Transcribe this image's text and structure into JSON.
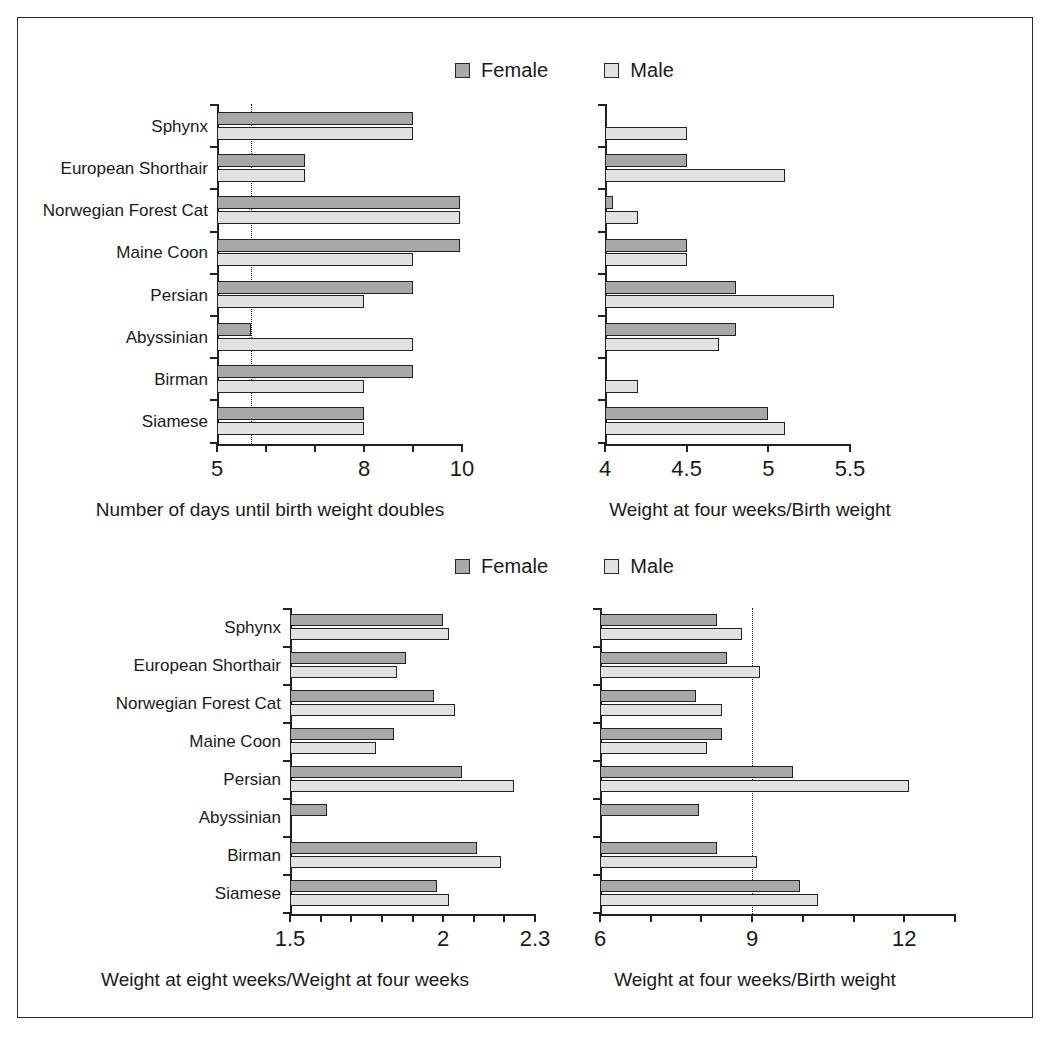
{
  "legend": {
    "female_label": "Female",
    "male_label": "Male",
    "female_color": "#a8a8a8",
    "male_color": "#e1e1e1"
  },
  "categories": [
    "Sphynx",
    "European Shorthair",
    "Norwegian Forest Cat",
    "Maine Coon",
    "Persian",
    "Abyssinian",
    "Birman",
    "Siamese"
  ],
  "chart_data": [
    {
      "id": "days-to-double-birth-weight",
      "type": "bar",
      "orientation": "horizontal",
      "title": "",
      "xlabel": "Number of days until birth weight doubles",
      "ylabel": "",
      "xlim": [
        5,
        10
      ],
      "xticks": [
        5,
        6,
        7,
        8,
        9,
        10
      ],
      "xticklabels": [
        "5",
        "",
        "",
        "8",
        "",
        "10"
      ],
      "grid": false,
      "reference_line": 5.7,
      "legend_position": "top",
      "categories": [
        "Sphynx",
        "European Shorthair",
        "Norwegian Forest Cat",
        "Maine Coon",
        "Persian",
        "Abyssinian",
        "Birman",
        "Siamese"
      ],
      "series": [
        {
          "name": "Female",
          "values": [
            9.0,
            6.8,
            9.95,
            9.95,
            9.0,
            5.7,
            9.0,
            8.0
          ]
        },
        {
          "name": "Male",
          "values": [
            9.0,
            6.8,
            9.95,
            9.0,
            8.0,
            9.0,
            8.0,
            8.0
          ]
        }
      ]
    },
    {
      "id": "four-week-over-birth-weight-top",
      "type": "bar",
      "orientation": "horizontal",
      "title": "",
      "xlabel": "Weight at four weeks/Birth weight",
      "ylabel": "",
      "xlim": [
        4,
        5.5
      ],
      "xticks": [
        4,
        4.5,
        5,
        5.5
      ],
      "xticklabels": [
        "4",
        "4.5",
        "5",
        "5.5"
      ],
      "grid": false,
      "reference_line": null,
      "legend_position": "top",
      "categories": [
        "Sphynx",
        "European Shorthair",
        "Norwegian Forest Cat",
        "Maine Coon",
        "Persian",
        "Abyssinian",
        "Birman",
        "Siamese"
      ],
      "series": [
        {
          "name": "Female",
          "values": [
            null,
            4.5,
            4.05,
            4.5,
            4.8,
            4.8,
            null,
            5.0
          ]
        },
        {
          "name": "Male",
          "values": [
            4.5,
            5.1,
            4.2,
            4.5,
            5.4,
            4.7,
            4.2,
            5.1
          ]
        }
      ]
    },
    {
      "id": "eight-week-over-four-week-weight",
      "type": "bar",
      "orientation": "horizontal",
      "title": "",
      "xlabel": "Weight at eight weeks/Weight at four weeks",
      "ylabel": "",
      "xlim": [
        1.5,
        2.3
      ],
      "xticks": [
        1.5,
        1.6,
        1.7,
        1.8,
        1.9,
        2.0,
        2.1,
        2.2,
        2.3
      ],
      "xticklabels": [
        "1.5",
        "",
        "",
        "",
        "",
        "2",
        "",
        "",
        "2.3"
      ],
      "grid": false,
      "reference_line": null,
      "legend_position": "top",
      "categories": [
        "Sphynx",
        "European Shorthair",
        "Norwegian Forest Cat",
        "Maine Coon",
        "Persian",
        "Abyssinian",
        "Birman",
        "Siamese"
      ],
      "series": [
        {
          "name": "Female",
          "values": [
            2.0,
            1.88,
            1.97,
            1.84,
            2.06,
            1.62,
            2.11,
            1.98
          ]
        },
        {
          "name": "Male",
          "values": [
            2.02,
            1.85,
            2.04,
            1.78,
            2.23,
            null,
            2.19,
            2.02
          ]
        }
      ]
    },
    {
      "id": "four-week-over-birth-weight-bottom",
      "type": "bar",
      "orientation": "horizontal",
      "title": "",
      "xlabel": "Weight at four weeks/Birth weight",
      "ylabel": "",
      "xlim": [
        6,
        13
      ],
      "xticks": [
        6,
        7,
        8,
        9,
        10,
        11,
        12,
        13
      ],
      "xticklabels": [
        "6",
        "",
        "",
        "9",
        "",
        "",
        "12",
        ""
      ],
      "grid": false,
      "reference_line": 9,
      "legend_position": "top",
      "categories": [
        "Sphynx",
        "European Shorthair",
        "Norwegian Forest Cat",
        "Maine Coon",
        "Persian",
        "Abyssinian",
        "Birman",
        "Siamese"
      ],
      "series": [
        {
          "name": "Female",
          "values": [
            8.3,
            8.5,
            7.9,
            8.4,
            9.8,
            7.95,
            8.3,
            9.95
          ]
        },
        {
          "name": "Male",
          "values": [
            8.8,
            9.15,
            8.4,
            8.1,
            12.1,
            null,
            9.1,
            10.3
          ]
        }
      ]
    }
  ]
}
